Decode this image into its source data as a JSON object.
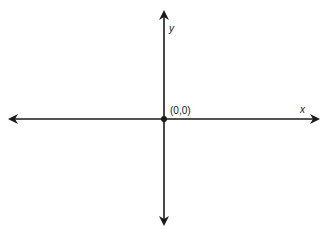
{
  "diagram": {
    "type": "coordinate-axes",
    "origin_label": "(0,0)",
    "x_axis_label": "x",
    "y_axis_label": "y",
    "colors": {
      "axis": "#1a1a1a",
      "background": "#ffffff"
    }
  }
}
